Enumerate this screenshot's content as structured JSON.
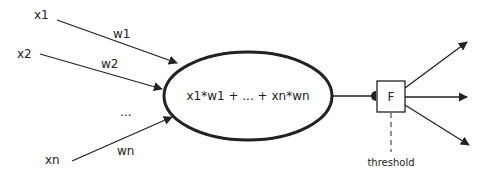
{
  "diagram": {
    "inputs": [
      {
        "label": "x1",
        "weight": "w1"
      },
      {
        "label": "x2",
        "weight": "w2"
      },
      {
        "label": "...",
        "weight": ""
      },
      {
        "label": "xn",
        "weight": "wn"
      }
    ],
    "sum_node": {
      "label": "x1*w1 + ... + xn*wn"
    },
    "activation": {
      "label": "F"
    },
    "threshold_label": "threshold",
    "outputs_count": 3,
    "colors": {
      "stroke": "#222222",
      "background": "#ffffff"
    }
  }
}
